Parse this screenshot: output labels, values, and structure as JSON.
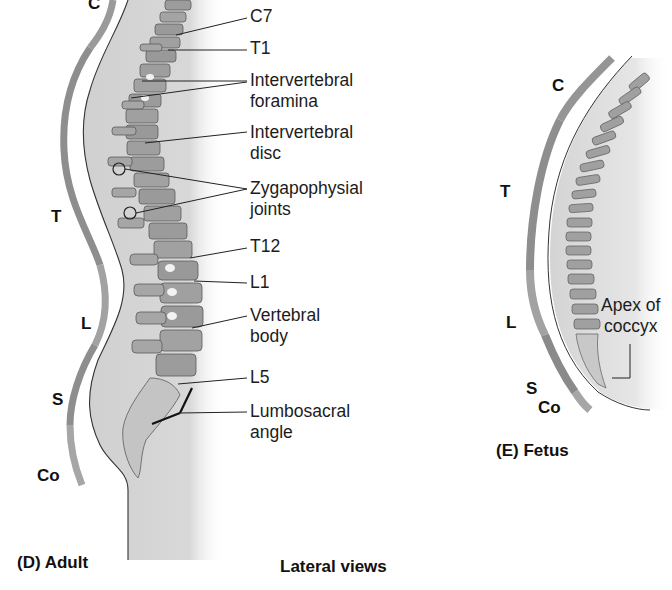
{
  "figure": {
    "caption_adult": "(D)  Adult",
    "caption_center": "Lateral views",
    "caption_fetus": "(E)  Fetus"
  },
  "adult": {
    "regions": [
      "C",
      "T",
      "L",
      "S",
      "Co"
    ],
    "labels": [
      {
        "id": "c7",
        "text": "C7"
      },
      {
        "id": "t1",
        "text": "T1"
      },
      {
        "id": "foramina",
        "line1": "Intervertebral",
        "line2": "foramina"
      },
      {
        "id": "disc",
        "line1": "Intervertebral",
        "line2": "disc"
      },
      {
        "id": "zyg",
        "line1": "Zygapophysial",
        "line2": "joints"
      },
      {
        "id": "t12",
        "text": "T12"
      },
      {
        "id": "l1",
        "text": "L1"
      },
      {
        "id": "body",
        "line1": "Vertebral",
        "line2": "body"
      },
      {
        "id": "l5",
        "text": "L5"
      },
      {
        "id": "lumbo",
        "line1": "Lumbosacral",
        "line2": "angle"
      }
    ]
  },
  "fetus": {
    "regions": [
      "C",
      "T",
      "L",
      "S",
      "Co"
    ],
    "labels": [
      {
        "id": "apex",
        "line1": "Apex of",
        "line2": "coccyx"
      }
    ]
  },
  "colors": {
    "region_bar_dark": "#8e8e8e",
    "region_bar_light": "#a8a8a8",
    "body_fill": "#d6d6d6",
    "bone": "#9a9a9a",
    "line": "#222222"
  }
}
